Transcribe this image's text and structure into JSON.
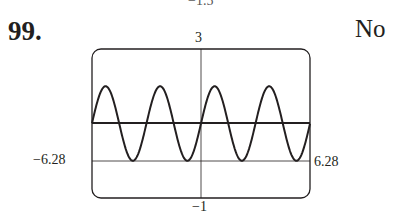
{
  "problem": {
    "number": "99.",
    "answer": "No",
    "top_cutoff_label": "−1.5"
  },
  "window": {
    "ymax_label": "3",
    "ymin_label": "−1",
    "xmin_label": "−6.28",
    "xmax_label": "6.28"
  },
  "chart_data": {
    "type": "line",
    "title": "",
    "xlabel": "",
    "ylabel": "",
    "xlim": [
      -6.28,
      6.28
    ],
    "ylim": [
      -1,
      3
    ],
    "grid": false,
    "tick_labels": {
      "x": [
        "-6.28",
        "6.28"
      ],
      "y": [
        "-1",
        "3"
      ]
    },
    "series": [
      {
        "name": "y = 1 + sin(2x)",
        "expression": "1 + sin(2x)",
        "style": "thick"
      },
      {
        "name": "y = 1",
        "expression": "1",
        "style": "thick"
      }
    ],
    "axes": {
      "x_axis_at_y": 0,
      "y_axis_at_x": 0
    }
  }
}
